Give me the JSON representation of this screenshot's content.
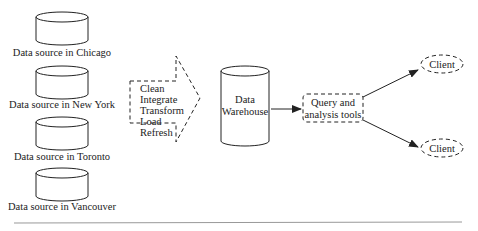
{
  "diagram": {
    "sources": [
      {
        "label": "Data source in Chicago"
      },
      {
        "label": "Data source in New York"
      },
      {
        "label": "Data source in Toronto"
      },
      {
        "label": "Data source in Vancouver"
      }
    ],
    "etl_steps": [
      "Clean",
      "Integrate",
      "Transform",
      "Load",
      "Refresh"
    ],
    "warehouse": {
      "line1": "Data",
      "line2": "Warehouse"
    },
    "tools": {
      "line1": "Query and",
      "line2": "analysis tools"
    },
    "clients": [
      {
        "label": "Client"
      },
      {
        "label": "Client"
      }
    ],
    "colors": {
      "stroke": "#222222",
      "background": "#ffffff",
      "rule": "#999999"
    }
  }
}
